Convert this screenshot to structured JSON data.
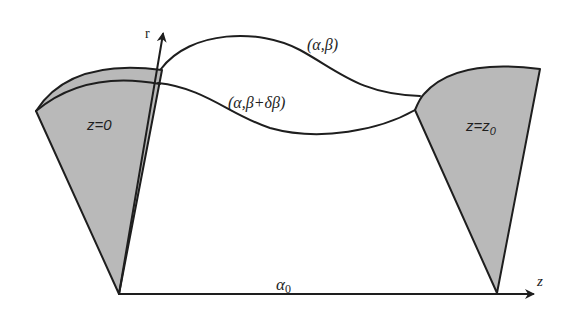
{
  "diagram": {
    "type": "geometry-schematic",
    "colors": {
      "line": "#1e1e1e",
      "cone_fill": "#b9b9b9",
      "background": "#ffffff"
    },
    "axes": {
      "r_label": "r",
      "z_label": "z",
      "base_label": "α",
      "base_label_sub": "0"
    },
    "regions": {
      "left_cone_label": "z=0",
      "right_cone_label_main": "z=z",
      "right_cone_label_sub": "0"
    },
    "curves": {
      "upper_label": "(α,β)",
      "lower_label": "(α,β+δβ)"
    }
  }
}
